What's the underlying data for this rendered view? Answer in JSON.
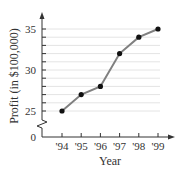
{
  "chart_data": {
    "type": "line",
    "title": "",
    "xlabel": "Year",
    "ylabel": "Profit (in $100,000)",
    "categories": [
      "'94",
      "'95",
      "'96",
      "'97",
      "'98",
      "'99"
    ],
    "series": [
      {
        "name": "Profit",
        "values": [
          25,
          27,
          28,
          32,
          34,
          35
        ]
      }
    ],
    "y_ticks": [
      0,
      25,
      30,
      35
    ],
    "ylim": [
      24,
      36
    ],
    "y_axis_break": true,
    "grid": "horizontal lines at each integer from 25 to 35",
    "legend": "none",
    "colors": {
      "line": "#808080",
      "marker": "#111111",
      "grid": "#e4e4e4",
      "axis": "#333333"
    }
  }
}
